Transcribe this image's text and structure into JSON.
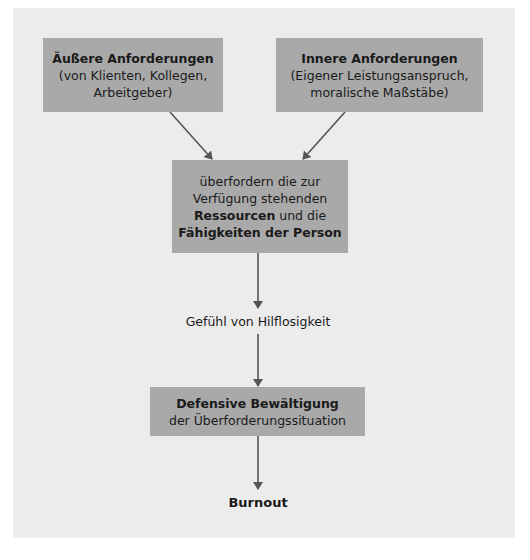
{
  "diagram": {
    "colors": {
      "panel": "#ececec",
      "box": "#a9a9a9",
      "arrow": "#555555",
      "text": "#1a1a1a"
    },
    "nodes": {
      "external": {
        "title": "Äußere Anforderungen",
        "line2": "(von Klienten, Kollegen,",
        "line3": "Arbeitgeber)"
      },
      "internal": {
        "title": "Innere Anforderungen",
        "line2": "(Eigener Leistungsanspruch,",
        "line3": "moralische Maßstäbe)"
      },
      "overload": {
        "line1": "überfordern die zur",
        "line2": "Verfügung stehenden",
        "line3_bold": "Ressourcen",
        "line3_rest": " und die",
        "line4_bold": "Fähigkeiten der Person"
      },
      "helplessness": {
        "text": "Gefühl von Hilflosigkeit"
      },
      "coping": {
        "title": "Defensive Bewältigung",
        "line2": "der Überforderungssituation"
      },
      "burnout": {
        "text": "Burnout"
      }
    },
    "edges": [
      {
        "from": "external",
        "to": "overload"
      },
      {
        "from": "internal",
        "to": "overload"
      },
      {
        "from": "overload",
        "to": "helplessness"
      },
      {
        "from": "helplessness",
        "to": "coping"
      },
      {
        "from": "coping",
        "to": "burnout"
      }
    ]
  }
}
